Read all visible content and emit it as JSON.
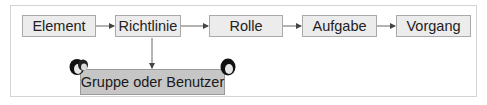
{
  "diagram": {
    "nodes": [
      {
        "id": "element",
        "label": "Element"
      },
      {
        "id": "richtlinie",
        "label": "Richtlinie"
      },
      {
        "id": "rolle",
        "label": "Rolle"
      },
      {
        "id": "aufgabe",
        "label": "Aufgabe"
      },
      {
        "id": "vorgang",
        "label": "Vorgang"
      }
    ],
    "group_node": {
      "id": "gruppe-oder-benutzer",
      "label": "Gruppe oder Benutzer"
    },
    "edges": [
      {
        "from": "element",
        "to": "richtlinie"
      },
      {
        "from": "richtlinie",
        "to": "rolle"
      },
      {
        "from": "rolle",
        "to": "aufgabe"
      },
      {
        "from": "aufgabe",
        "to": "vorgang"
      },
      {
        "from": "richtlinie",
        "to": "gruppe-oder-benutzer"
      }
    ],
    "icons": [
      {
        "name": "user-group-icon",
        "position": "left"
      },
      {
        "name": "user-icon",
        "position": "right"
      }
    ],
    "colors": {
      "node_fill": "#ececec",
      "group_fill": "#c6c6c6",
      "border": "#a9a9a9",
      "arrow": "#555555"
    }
  }
}
